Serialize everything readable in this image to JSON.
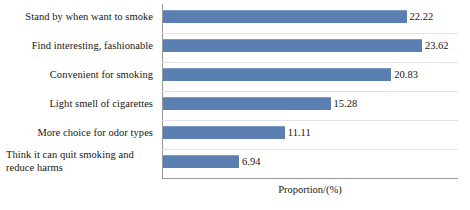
{
  "chart_data": {
    "type": "bar",
    "orientation": "horizontal",
    "title": "",
    "xlabel": "Proportion/(%)",
    "ylabel": "",
    "xlim": [
      0,
      27
    ],
    "grid": true,
    "legend": "none",
    "categories": [
      "Stand by when want to smoke",
      "Find interesting, fashionable",
      "Convenient for smoking",
      "Light smell of cigarettes",
      "More choice for odor types",
      "Think it can quit smoking and reduce harms"
    ],
    "values": [
      22.22,
      23.62,
      20.83,
      15.28,
      11.11,
      6.94
    ],
    "value_labels": [
      "22.22",
      "23.62",
      "20.83",
      "15.28",
      "11.11",
      "6.94"
    ],
    "series_color": "#5b7fb0",
    "axis_color": "#9a9a9a",
    "grid_color": "#dfe3e8"
  },
  "axis": {
    "x_title": "Proportion/(%)"
  }
}
